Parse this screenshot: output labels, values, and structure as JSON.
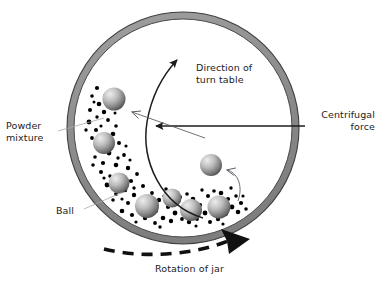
{
  "diagram": {
    "labels": {
      "direction_turn_table": "Direction of\nturn table",
      "centrifugal_force": "Centrifugal\nforce",
      "powder_mixture": "Powder\nmixture",
      "ball": "Ball",
      "rotation_of_jar": "Rotation of jar"
    },
    "colors": {
      "jar_wall_fill": "#8f8f8f",
      "jar_wall_stroke": "#3a3a3a",
      "jar_interior": "#ffffff",
      "ball_light": "#e8e8e8",
      "ball_dark": "#4a4a4a",
      "powder_dot": "#000000",
      "arrow_dark": "#1c1c1c",
      "leader_line": "#9a9a9a",
      "text": "#1c1c1c"
    },
    "jar": {
      "center_x": 183,
      "center_y": 128,
      "outer_radius": 116,
      "wall_thickness": 7
    },
    "balls": [
      {
        "cx": 114,
        "cy": 99,
        "r": 11.5
      },
      {
        "cx": 104,
        "cy": 143,
        "r": 11.0
      },
      {
        "cx": 119,
        "cy": 183,
        "r": 10.5
      },
      {
        "cx": 147,
        "cy": 206,
        "r": 12.0
      },
      {
        "cx": 172,
        "cy": 198,
        "r": 9.5
      },
      {
        "cx": 191,
        "cy": 210,
        "r": 11.0
      },
      {
        "cx": 219,
        "cy": 207,
        "r": 11.5
      },
      {
        "cx": 211,
        "cy": 165,
        "r": 11.0
      }
    ],
    "powder_dot_count": 96,
    "arrows": {
      "turn_table": {
        "type": "curved",
        "direction": "counterclockwise",
        "head": "solid"
      },
      "centrifugal": {
        "type": "straight",
        "direction": "left",
        "head": "solid"
      },
      "rotation_jar": {
        "type": "dashed-arc",
        "direction": "clockwise",
        "head": "solid-large"
      },
      "pointer_rising_ball": {
        "type": "thin-open-head"
      },
      "pointer_flying_ball": {
        "type": "thin-curved-open-head"
      }
    }
  }
}
